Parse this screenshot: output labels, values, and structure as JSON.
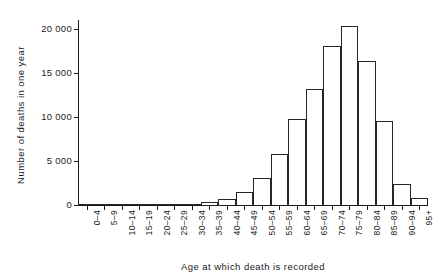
{
  "chart_data": {
    "type": "bar",
    "title": "",
    "xlabel": "Age at which death is recorded",
    "ylabel": "Number of deaths in one year",
    "categories": [
      "0–4",
      "5–9",
      "10–14",
      "15–19",
      "20–24",
      "25–29",
      "30–34",
      "35–39",
      "40–44",
      "45–49",
      "50–54",
      "55–59",
      "60–64",
      "65–69",
      "70–74",
      "75–79",
      "80–84",
      "85–89",
      "90–94",
      "95+"
    ],
    "values": [
      60,
      30,
      30,
      50,
      60,
      80,
      150,
      350,
      700,
      1450,
      3100,
      5800,
      9800,
      13200,
      18100,
      20300,
      16400,
      9550,
      2400,
      850
    ],
    "ylim": [
      0,
      20800
    ],
    "yticks": [
      0,
      5000,
      10000,
      15000,
      20000
    ],
    "ytick_labels": [
      "0",
      "5 000",
      "10 000",
      "15 000",
      "20 000"
    ],
    "grid": false,
    "legend": null,
    "bar_style": {
      "fill": "#ffffff",
      "stroke": "#262626"
    }
  },
  "axis": {
    "y_title": "Number of deaths in one year",
    "x_title": "Age at which death is recorded"
  }
}
